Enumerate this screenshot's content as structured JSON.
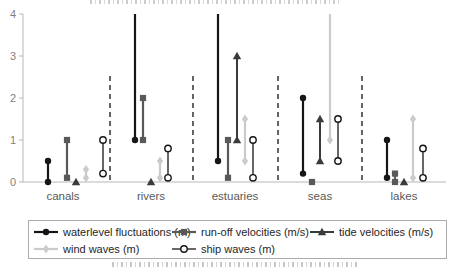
{
  "chart_data": {
    "type": "range-bar",
    "title": "",
    "xlabel": "",
    "ylabel": "",
    "ylim": [
      0,
      4
    ],
    "yticks": [
      0,
      1,
      2,
      3,
      4
    ],
    "grid": false,
    "legend_position": "bottom-box",
    "categories": [
      "canals",
      "rivers",
      "estuaries",
      "seas",
      "lakes"
    ],
    "series": [
      {
        "name": "waterlevel fluctuations (m)",
        "marker": "filled-circle",
        "color": "#161616",
        "ranges": [
          [
            0,
            0.5
          ],
          [
            1,
            4
          ],
          [
            0.5,
            4
          ],
          [
            0.2,
            2
          ],
          [
            0.1,
            1
          ]
        ],
        "clip_top": [
          false,
          true,
          true,
          false,
          false
        ]
      },
      {
        "name": "run-off velocities (m/s)",
        "marker": "filled-square",
        "color": "#595959",
        "ranges": [
          [
            0.1,
            1
          ],
          [
            1,
            2
          ],
          [
            0.1,
            1
          ],
          [
            0,
            0
          ],
          [
            0,
            0.2
          ]
        ],
        "clip_top": [
          false,
          false,
          false,
          false,
          false
        ]
      },
      {
        "name": "tide velocities (m/s)",
        "marker": "filled-triangle",
        "color": "#3b3b3b",
        "ranges": [
          [
            0,
            0
          ],
          [
            0,
            0
          ],
          [
            1,
            3
          ],
          [
            0.5,
            1.5
          ],
          [
            0,
            0
          ]
        ],
        "clip_top": [
          false,
          false,
          false,
          false,
          false
        ]
      },
      {
        "name": "wind waves (m)",
        "marker": "filled-diamond",
        "color": "#cbcbcb",
        "ranges": [
          [
            0.1,
            0.3
          ],
          [
            0.1,
            0.5
          ],
          [
            0.5,
            1.5
          ],
          [
            1,
            4
          ],
          [
            0.1,
            1.5
          ]
        ],
        "clip_top": [
          false,
          false,
          false,
          true,
          false
        ]
      },
      {
        "name": "ship waves (m)",
        "marker": "open-circle",
        "color": "#161616",
        "ranges": [
          [
            0.2,
            1
          ],
          [
            0.1,
            0.8
          ],
          [
            0.1,
            1
          ],
          [
            0.5,
            1.5
          ],
          [
            0.1,
            0.8
          ]
        ],
        "clip_top": [
          false,
          false,
          false,
          false,
          false
        ]
      }
    ],
    "axis_color": "#b7b7b7",
    "separator_color": "#3f3f3f"
  }
}
